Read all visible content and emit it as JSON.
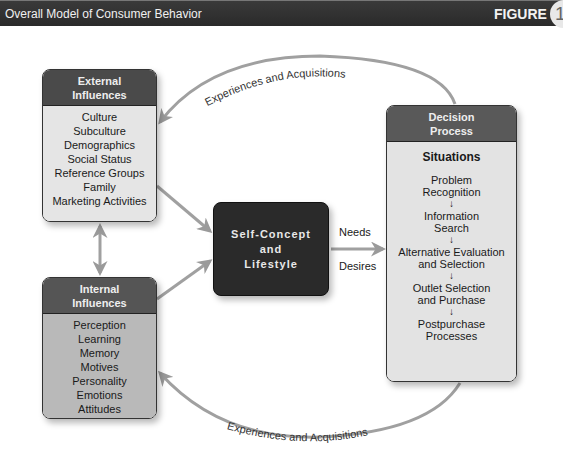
{
  "header": {
    "title": "Overall Model of Consumer Behavior",
    "figure_label": "FIGURE",
    "figure_number": "1-3"
  },
  "external_influences": {
    "title_line1": "External",
    "title_line2": "Influences",
    "items": [
      "Culture",
      "Subculture",
      "Demographics",
      "Social Status",
      "Reference Groups",
      "Family",
      "Marketing Activities"
    ]
  },
  "internal_influences": {
    "title_line1": "Internal",
    "title_line2": "Influences",
    "items": [
      "Perception",
      "Learning",
      "Memory",
      "Motives",
      "Personality",
      "Emotions",
      "Attitudes"
    ]
  },
  "self_concept": {
    "line1": "Self-Concept",
    "line2": "and",
    "line3": "Lifestyle"
  },
  "connector_labels": {
    "needs": "Needs",
    "desires": "Desires",
    "top_arc": "Experiences and Acquisitions",
    "bottom_arc": "Experiences and Acquisitions"
  },
  "decision_process": {
    "title_line1": "Decision",
    "title_line2": "Process",
    "situations": "Situations",
    "steps": [
      {
        "line1": "Problem",
        "line2": "Recognition"
      },
      {
        "line1": "Information",
        "line2": "Search"
      },
      {
        "line1": "Alternative Evaluation",
        "line2": "and Selection"
      },
      {
        "line1": "Outlet Selection",
        "line2": "and Purchase"
      },
      {
        "line1": "Postpurchase",
        "line2": "Processes"
      }
    ],
    "arrow_glyph": "↓"
  },
  "colors": {
    "header_bg": "#2e2e2e",
    "box_header": "#4a4a4a",
    "external_body": "#e5e5e5",
    "internal_body": "#b9b9b9",
    "self_concept_bg": "#2a2a2a",
    "decision_body": "#e3e3e3",
    "connector": "#9a9a9a"
  }
}
